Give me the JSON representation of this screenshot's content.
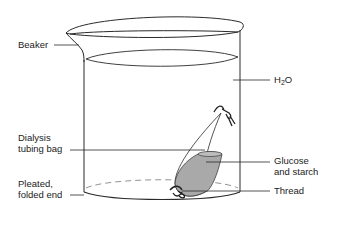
{
  "diagram": {
    "labels": {
      "beaker": "Beaker",
      "water_main": "H",
      "water_sub": "2",
      "water_tail": "O",
      "dialysis_line1": "Dialysis",
      "dialysis_line2": "tubing bag",
      "pleated_line1": "Pleated,",
      "pleated_line2": "folded end",
      "glucose_line1": "Glucose",
      "glucose_line2": "and starch",
      "thread": "Thread"
    },
    "colors": {
      "line": "#2a2a2a",
      "solution_fill": "#a9a9a9",
      "dash": "#777777"
    }
  }
}
